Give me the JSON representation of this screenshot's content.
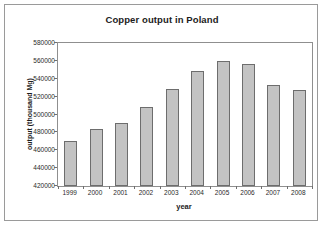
{
  "chart_data": {
    "type": "bar",
    "title": "Copper output in Poland",
    "xlabel": "year",
    "ylabel": "output (thousand Mg)",
    "categories": [
      "1999",
      "2000",
      "2001",
      "2002",
      "2003",
      "2004",
      "2005",
      "2006",
      "2007",
      "2008"
    ],
    "values": [
      470000,
      484000,
      490000,
      508000,
      529000,
      549000,
      560000,
      556000,
      533000,
      527000
    ],
    "ylim": [
      420000,
      580000
    ],
    "ytick_step": 20000,
    "yticks": [
      580000,
      560000,
      540000,
      520000,
      500000,
      480000,
      460000,
      440000,
      420000
    ],
    "ytick_labels": [
      "580000",
      "560000",
      "540000",
      "520000",
      "500000",
      "480000",
      "460000",
      "440000",
      "420000"
    ],
    "grid": false,
    "legend": false,
    "legend_position": "none",
    "series": [
      {
        "name": "Copper output",
        "values": [
          470000,
          484000,
          490000,
          508000,
          529000,
          549000,
          560000,
          556000,
          533000,
          527000
        ]
      }
    ],
    "colors": {
      "bar_fill": "#c3c3c3",
      "bar_border": "#6d6d6d",
      "axis": "#8f8f8f",
      "text": "#1c1c1c",
      "frame": "#9a9a9a",
      "background": "#ffffff"
    }
  }
}
